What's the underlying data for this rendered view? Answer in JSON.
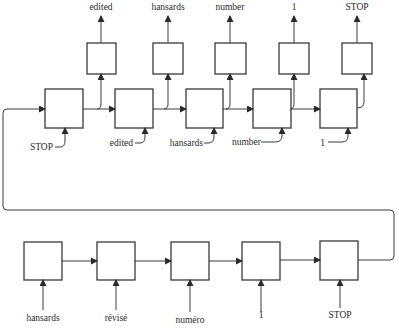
{
  "diagram": {
    "type": "sequence-to-sequence encoder-decoder",
    "encoder": {
      "inputs": [
        "hansards",
        "révisé",
        "numéro",
        "1",
        "STOP"
      ]
    },
    "decoder": {
      "inputs": [
        "STOP",
        "edited",
        "hansards",
        "number",
        "1"
      ],
      "outputs": [
        "edited",
        "hansards",
        "number",
        "1",
        "STOP"
      ]
    }
  },
  "colors": {
    "stroke": "#3a3a3a",
    "text": "#2a2a2a",
    "background": "#ffffff"
  }
}
